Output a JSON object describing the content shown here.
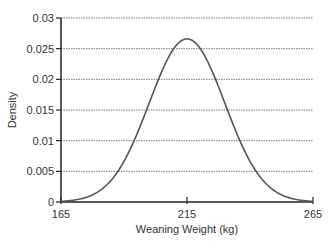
{
  "chart_data": {
    "type": "line",
    "title": "",
    "xlabel": "Weaning Weight (kg)",
    "ylabel": "Density",
    "xlim": [
      165,
      265
    ],
    "ylim": [
      0,
      0.03
    ],
    "x_ticks": [
      "165",
      "215",
      "265"
    ],
    "x_tick_values": [
      165,
      215,
      265
    ],
    "y_ticks": [
      "0",
      "0.005",
      "0.01",
      "0.015",
      "0.02",
      "0.025",
      "0.03"
    ],
    "y_tick_values": [
      0,
      0.005,
      0.01,
      0.015,
      0.02,
      0.025,
      0.03
    ],
    "grid": "horizontal dotted",
    "legend": null,
    "series": [
      {
        "name": "Normal density (mean 215, sd ~15)",
        "mean": 215,
        "sd": 15,
        "x": [
          165,
          170,
          175,
          180,
          185,
          190,
          195,
          200,
          205,
          210,
          215,
          220,
          225,
          230,
          235,
          240,
          245,
          250,
          255,
          260,
          265
        ],
        "values": [
          0.0001,
          0.0003,
          0.0007,
          0.0015,
          0.0036,
          0.0067,
          0.0109,
          0.0161,
          0.0213,
          0.0252,
          0.0266,
          0.0252,
          0.0213,
          0.0161,
          0.0109,
          0.0067,
          0.0036,
          0.0015,
          0.0007,
          0.0003,
          0.0001
        ]
      }
    ],
    "colors": {
      "curve": "#555555",
      "axis": "#222222",
      "grid": "#555555"
    }
  }
}
